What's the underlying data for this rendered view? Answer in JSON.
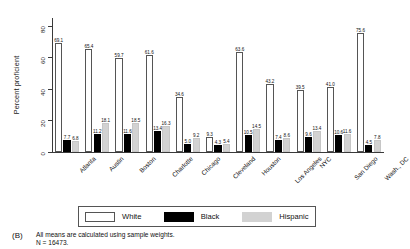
{
  "chart_data": {
    "type": "bar",
    "title": "",
    "xlabel": "",
    "ylabel": "Percent proficient",
    "ylim": [
      0,
      85
    ],
    "yticks": [
      0,
      20,
      40,
      60,
      80
    ],
    "grid": false,
    "legend_position": "bottom",
    "categories": [
      "Atlanta",
      "Austin",
      "Boston",
      "Charlotte",
      "Chicago",
      "Cleveland",
      "Houston",
      "Los Angeles",
      "NYC",
      "San Diego",
      "Wash., DC"
    ],
    "series": [
      {
        "name": "White",
        "color": "#ffffff",
        "values": [
          69.1,
          65.4,
          59.7,
          61.6,
          34.6,
          9.3,
          63.6,
          43.2,
          39.5,
          41.0,
          75.6
        ]
      },
      {
        "name": "Black",
        "color": "#000000",
        "values": [
          7.7,
          11.2,
          11.6,
          13.4,
          5.0,
          4.3,
          10.5,
          7.4,
          9.6,
          10.6,
          4.5
        ]
      },
      {
        "name": "Hispanic",
        "color": "#d2d2d2",
        "values": [
          6.8,
          18.1,
          18.5,
          16.3,
          9.2,
          5.4,
          14.5,
          8.6,
          13.4,
          11.6,
          7.8
        ]
      }
    ]
  },
  "legend": {
    "items": [
      {
        "label": "White"
      },
      {
        "label": "Black"
      },
      {
        "label": "Hispanic"
      }
    ]
  },
  "caption": {
    "tag": "(B)",
    "line1": "All means are calculated using sample weights.",
    "line2": "N = 16473."
  }
}
